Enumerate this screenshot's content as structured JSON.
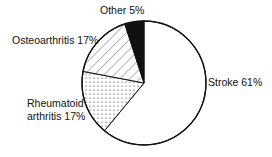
{
  "chart_data": {
    "type": "pie",
    "title": "",
    "slices": [
      {
        "label": "Stroke",
        "value": 61,
        "pattern": "white",
        "display": "Stroke 61%"
      },
      {
        "label": "Rheumatoid arthritis",
        "value": 17,
        "pattern": "dots",
        "display_line1": "Rheumatoid",
        "display_line2": "arthritis 17%"
      },
      {
        "label": "Osteoarthritis",
        "value": 17,
        "pattern": "diagonal-hatch",
        "display": "Osteoarthritis 17%"
      },
      {
        "label": "Other",
        "value": 5,
        "pattern": "black",
        "display": "Other 5%"
      }
    ],
    "start_angle_deg": 0,
    "direction": "clockwise",
    "legend": "none",
    "units": "%"
  },
  "geometry": {
    "cx": 144,
    "cy": 83,
    "r": 62
  },
  "colors": {
    "stroke": "#111111",
    "fill_white": "#ffffff",
    "fill_black": "#111111"
  }
}
